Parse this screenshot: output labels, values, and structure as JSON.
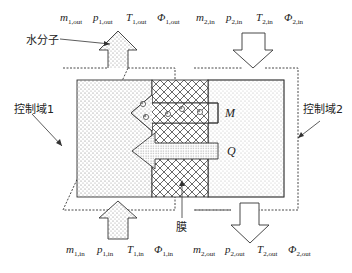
{
  "diagram": {
    "top_labels": [
      {
        "var": "m",
        "sub": "1,out"
      },
      {
        "var": "p",
        "sub": "1,out"
      },
      {
        "var": "T",
        "sub": "1,out"
      },
      {
        "var": "Φ",
        "sub": "1,out"
      },
      {
        "var": "m",
        "sub": "2,in"
      },
      {
        "var": "p",
        "sub": "2,in"
      },
      {
        "var": "T",
        "sub": "2,in"
      },
      {
        "var": "Φ",
        "sub": "2,in"
      }
    ],
    "bottom_labels": [
      {
        "var": "m",
        "sub": "1,in"
      },
      {
        "var": "p",
        "sub": "1,in"
      },
      {
        "var": "T",
        "sub": "1,in"
      },
      {
        "var": "Φ",
        "sub": "1,in"
      },
      {
        "var": "m",
        "sub": "2,out"
      },
      {
        "var": "p",
        "sub": "2,out"
      },
      {
        "var": "T",
        "sub": "2,out"
      },
      {
        "var": "Φ",
        "sub": "2,out"
      }
    ],
    "water_molecule_label": "水分子",
    "control_volume_1_label": "控制域1",
    "control_volume_2_label": "控制域2",
    "membrane_label": "膜",
    "mass_flux_symbol": "M",
    "heat_flux_symbol": "Q",
    "colors": {
      "stroke": "#333333",
      "stipple": "#888888",
      "hatch": "#555555"
    }
  }
}
